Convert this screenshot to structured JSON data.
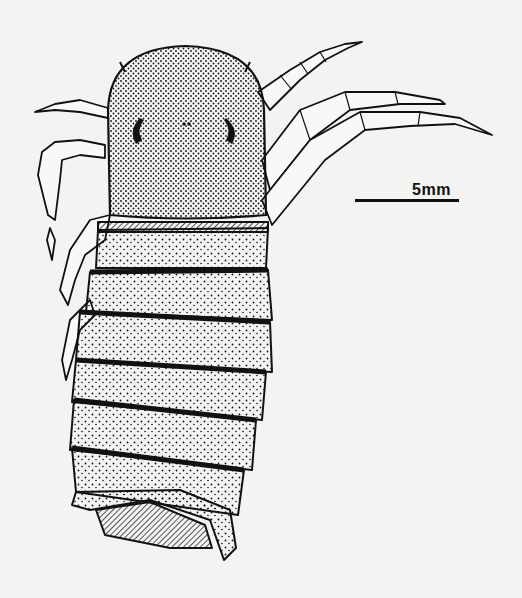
{
  "figure": {
    "background_color": "#f3f3f1",
    "ink_color": "#111111",
    "scale_bar": {
      "label": "5mm",
      "length_px": 104
    },
    "body_segments": 7,
    "head": {
      "eyes": 2,
      "spines": 2
    }
  }
}
